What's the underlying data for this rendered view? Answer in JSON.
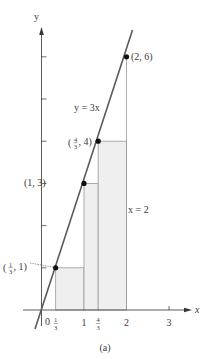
{
  "figure": {
    "caption": "(a)",
    "colors": {
      "background": "#ffffff",
      "axis": "#4a4a4a",
      "line": "#5a5a5a",
      "grid": "#9a9a9a",
      "fill": "#efefef",
      "point": "#111111",
      "text": "#3a3a3a"
    },
    "axes": {
      "x_label": "x",
      "y_label": "y",
      "origin_label": "0",
      "x_ticks": [
        {
          "value": 0.3333,
          "label_num": "1",
          "label_den": "3"
        },
        {
          "value": 1,
          "label": "1"
        },
        {
          "value": 1.3333,
          "label_num": "4",
          "label_den": "3"
        },
        {
          "value": 2,
          "label": "2"
        },
        {
          "value": 3,
          "label": "3"
        }
      ],
      "y_ticks": [
        1,
        2,
        3,
        4,
        5,
        6
      ]
    },
    "line": {
      "equation_label": "y = 3x",
      "slope": 3
    },
    "vertical_line_label": "x = 2",
    "points": [
      {
        "x": 0.3333,
        "y": 1,
        "label_num": "1",
        "label_den": "3",
        "label_tail": ", 1)"
      },
      {
        "x": 1,
        "y": 3,
        "label": "(1, 3)"
      },
      {
        "x": 1.3333,
        "y": 4,
        "label_num": "4",
        "label_den": "3",
        "label_tail": ", 4)"
      },
      {
        "x": 2,
        "y": 6,
        "label": "(2, 6)"
      }
    ],
    "rectangles": [
      {
        "x_from": 0.3333,
        "x_to": 1,
        "height": 1
      },
      {
        "x_from": 1,
        "x_to": 1.3333,
        "height": 3
      },
      {
        "x_from": 1.3333,
        "x_to": 2,
        "height": 4
      }
    ]
  }
}
